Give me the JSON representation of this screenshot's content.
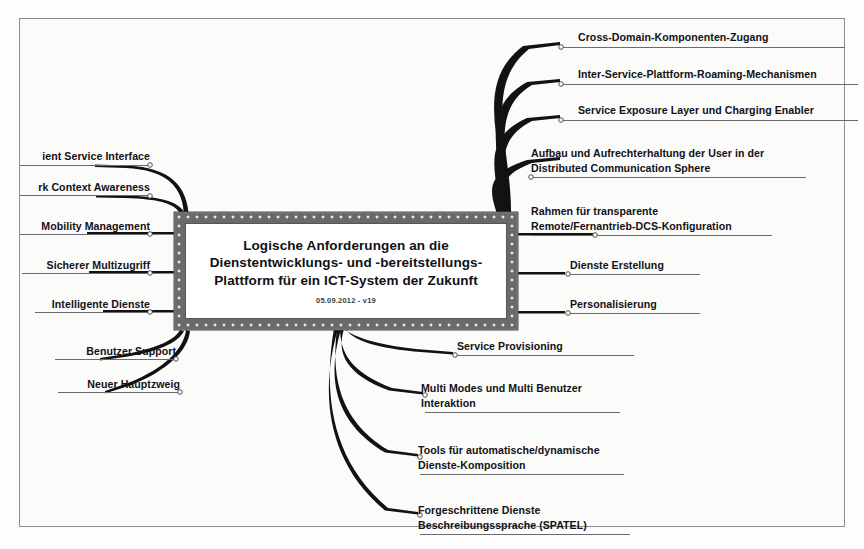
{
  "document": {
    "type": "mind-map",
    "background_color": "#fbfbfa",
    "frame_color": "#3a3a3c"
  },
  "center": {
    "title": "Logische Anforderungen an die\nDienstentwicklungs- und -bereitstellungs-\nPlattform für ein ICT-System der Zukunft",
    "date": "05.09.2012 - v19",
    "fill_color": "#6f6f71",
    "inner_color": "#ffffff"
  },
  "branches": {
    "right": [
      {
        "label": "Cross-Domain-Komponenten-Zugang"
      },
      {
        "label": "Inter-Service-Plattform-Roaming-Mechanismen"
      },
      {
        "label": "Service Exposure Layer und Charging Enabler"
      },
      {
        "label": "Aufbau und Aufrechterhaltung der User in der\nDistributed Communication Sphere"
      },
      {
        "label": "Rahmen für transparente\nRemote/Fernantrieb-DCS-Konfiguration"
      },
      {
        "label": "Dienste Erstellung"
      },
      {
        "label": "Personalisierung"
      },
      {
        "label": "Service Provisioning"
      },
      {
        "label": "Multi Modes und Multi Benutzer\nInteraktion"
      },
      {
        "label": "Tools für automatische/dynamische\nDienste-Komposition"
      },
      {
        "label": "Forgeschrittene Dienste\nBeschreibungssprache (SPATEL)"
      }
    ],
    "left": [
      {
        "label": "ient Service Interface"
      },
      {
        "label": "rk Context Awareness"
      },
      {
        "label": "Mobility Management"
      },
      {
        "label": "Sicherer Multizugriff"
      },
      {
        "label": "Intelligente Dienste"
      },
      {
        "label": "Benutzer Support"
      },
      {
        "label": "Neuer Hauptzweig"
      }
    ]
  }
}
